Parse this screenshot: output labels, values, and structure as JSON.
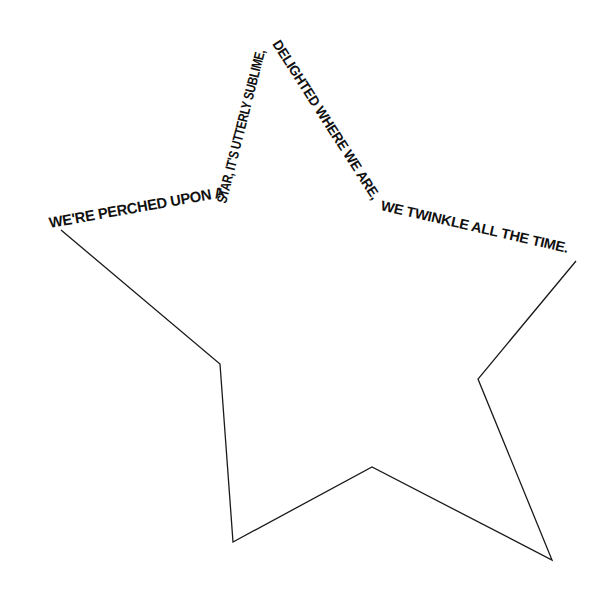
{
  "poem": {
    "segments": [
      {
        "id": "seg1",
        "text": "WE'RE PERCHED UPON A",
        "size": 15
      },
      {
        "id": "seg2",
        "text": "STAR, IT'S UTTERLY SUBLIME,",
        "size": 14
      },
      {
        "id": "seg3",
        "text": "DELIGHTED WHERE WE ARE,",
        "size": 14
      },
      {
        "id": "seg4",
        "text": "WE TWINKLE ALL THE TIME.",
        "size": 14
      }
    ]
  },
  "star": {
    "stroke_color": "#1a1a1a",
    "vertices": [
      [
        61,
        230
      ],
      [
        220,
        364
      ],
      [
        233,
        542
      ],
      [
        372,
        467
      ],
      [
        552,
        560
      ],
      [
        478,
        379
      ],
      [
        576,
        261
      ]
    ]
  }
}
